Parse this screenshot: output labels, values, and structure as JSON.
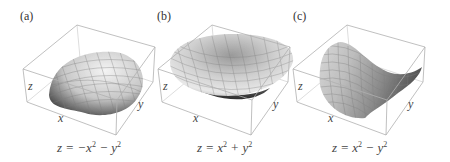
{
  "figure": {
    "panels": [
      {
        "label": "(a)",
        "surface": "paraboloid-cap",
        "equation": {
          "lhs": "z = −x",
          "mid": " − y",
          "exp1": "2",
          "exp2": "2"
        },
        "axes": {
          "x": "x",
          "y": "y",
          "z": "z"
        }
      },
      {
        "label": "(b)",
        "surface": "paraboloid-bowl",
        "equation": {
          "lhs": "z = x",
          "mid": " + y",
          "exp1": "2",
          "exp2": "2"
        },
        "axes": {
          "x": "x",
          "y": "y",
          "z": "z"
        }
      },
      {
        "label": "(c)",
        "surface": "hyperbolic-paraboloid-saddle",
        "equation": {
          "lhs": "z = x",
          "mid": " − y",
          "exp1": "2",
          "exp2": "2"
        },
        "axes": {
          "x": "x",
          "y": "y",
          "z": "z"
        }
      }
    ],
    "colors": {
      "box": "#b8b8b8",
      "surface_light": "#f2f2f2",
      "surface_dark": "#4a4a4a",
      "mesh": "#8a8a8a"
    }
  }
}
